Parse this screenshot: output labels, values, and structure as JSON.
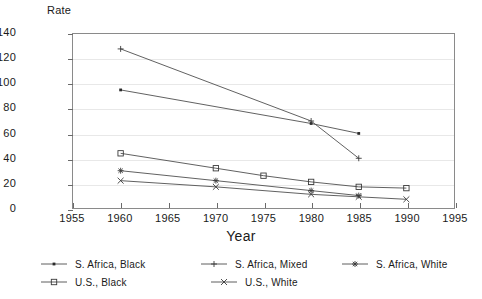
{
  "chart_data": {
    "type": "line",
    "title": "",
    "xlabel": "Year",
    "ylabel": "Rate",
    "xlim": [
      1955,
      1995
    ],
    "ylim": [
      0,
      140
    ],
    "xticks": [
      1955,
      1960,
      1965,
      1970,
      1975,
      1980,
      1985,
      1990,
      1995
    ],
    "yticks": [
      0,
      20,
      40,
      60,
      80,
      100,
      120,
      140
    ],
    "grid": true,
    "legend_position": "bottom",
    "series": [
      {
        "name": "S. Africa, Black",
        "marker": "dot",
        "x": [
          1960,
          1980,
          1985
        ],
        "values": [
          95,
          68,
          60
        ]
      },
      {
        "name": "S. Africa, Mixed",
        "marker": "plus",
        "x": [
          1960,
          1980,
          1985
        ],
        "values": [
          128,
          70,
          40
        ]
      },
      {
        "name": "S. Africa, White",
        "marker": "asterisk",
        "x": [
          1960,
          1970,
          1980,
          1985
        ],
        "values": [
          30,
          22,
          14,
          10
        ]
      },
      {
        "name": "U.S., Black",
        "marker": "square",
        "x": [
          1960,
          1970,
          1975,
          1980,
          1985,
          1990
        ],
        "values": [
          44,
          32,
          26,
          21,
          17,
          16
        ]
      },
      {
        "name": "U.S., White",
        "marker": "cross",
        "x": [
          1960,
          1970,
          1980,
          1985,
          1990
        ],
        "values": [
          22,
          17,
          11,
          9,
          7
        ]
      }
    ]
  },
  "axis": {
    "ylabel_text": "Rate",
    "xlabel_text": "Year"
  },
  "legend": {
    "rows": [
      [
        {
          "label": "S. Africa, Black",
          "marker": "dot"
        },
        {
          "label": "S. Africa, Mixed",
          "marker": "plus"
        },
        {
          "label": "S. Africa, White",
          "marker": "asterisk"
        }
      ],
      [
        {
          "label": "U.S., Black",
          "marker": "square"
        },
        {
          "label": "U.S., White",
          "marker": "cross"
        }
      ]
    ]
  },
  "colors": {
    "line": "#4d4d4d",
    "marker": "#3a3a3a",
    "grid": "#e8e8e8",
    "frame": "#8a8a8a",
    "text": "#1a1a1a"
  }
}
